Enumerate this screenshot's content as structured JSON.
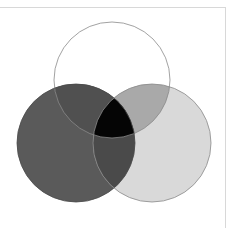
{
  "diagram": {
    "type": "venn",
    "sets": [
      {
        "id": "top",
        "fill": "#ffffff",
        "stroke": "#8a8a8a"
      },
      {
        "id": "left",
        "fill": "#5a5a5a",
        "stroke": "#4a4a4a"
      },
      {
        "id": "right",
        "fill": "#d9d9d9",
        "stroke": "#8a8a8a"
      }
    ],
    "regions": {
      "top_left": "#505050",
      "top_right": "#a9a9a9",
      "left_right": "#4a4a4a",
      "all_three": "#050505"
    },
    "frame_color": "#d8d8d8"
  }
}
